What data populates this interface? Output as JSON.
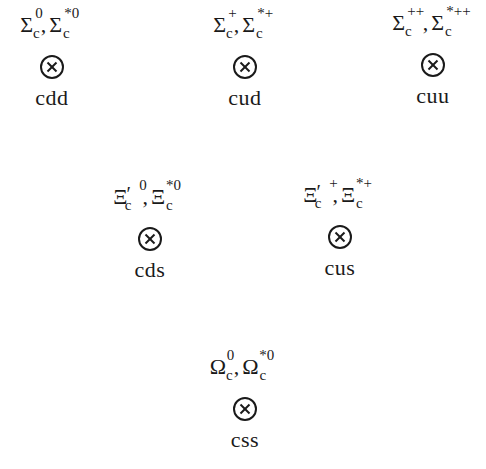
{
  "diagram": {
    "title": "",
    "type": "charmed baryon sextet (quark content)",
    "symbol_icon": "circled-times-icon",
    "nodes": [
      {
        "id": "cdd",
        "row": 1,
        "position": "top-left",
        "particle1": {
          "base": "Σ",
          "sub": "c",
          "sup": "0",
          "prime": ""
        },
        "particle2": {
          "base": "Σ",
          "sub": "c",
          "sup": "*0"
        },
        "separator": ",",
        "quarks": "cdd"
      },
      {
        "id": "cud",
        "row": 1,
        "position": "top-center",
        "particle1": {
          "base": "Σ",
          "sub": "c",
          "sup": "+",
          "prime": ""
        },
        "particle2": {
          "base": "Σ",
          "sub": "c",
          "sup": "*+"
        },
        "separator": ",",
        "quarks": "cud"
      },
      {
        "id": "cuu",
        "row": 1,
        "position": "top-right",
        "particle1": {
          "base": "Σ",
          "sub": "c",
          "sup": "++",
          "prime": ""
        },
        "particle2": {
          "base": "Σ",
          "sub": "c",
          "sup": "*++"
        },
        "separator": ",",
        "quarks": "cuu"
      },
      {
        "id": "cds",
        "row": 2,
        "position": "middle-left",
        "particle1": {
          "base": "Ξ",
          "sub": "c",
          "sup": "0",
          "prime": "′"
        },
        "particle2": {
          "base": "Ξ",
          "sub": "c",
          "sup": "*0"
        },
        "separator": ",",
        "quarks": "cds"
      },
      {
        "id": "cus",
        "row": 2,
        "position": "middle-right",
        "particle1": {
          "base": "Ξ",
          "sub": "c",
          "sup": "+",
          "prime": "′"
        },
        "particle2": {
          "base": "Ξ",
          "sub": "c",
          "sup": "*+"
        },
        "separator": ",",
        "quarks": "cus"
      },
      {
        "id": "css",
        "row": 3,
        "position": "bottom-center",
        "particle1": {
          "base": "Ω",
          "sub": "c",
          "sup": "0",
          "prime": ""
        },
        "particle2": {
          "base": "Ω",
          "sub": "c",
          "sup": "*0"
        },
        "separator": ",",
        "quarks": "css"
      }
    ]
  }
}
